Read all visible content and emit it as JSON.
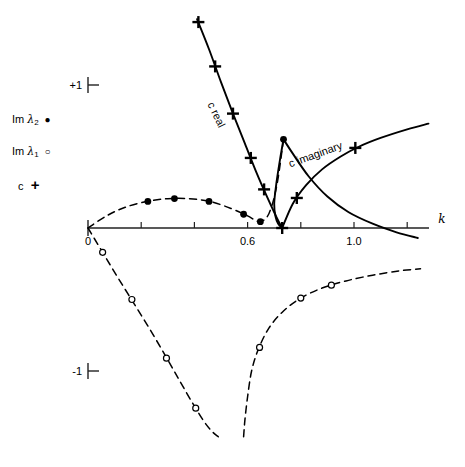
{
  "figure": {
    "title": "",
    "axis_x_label": "k",
    "axis_y_label": ""
  },
  "legend": {
    "items": [
      {
        "name": "im-lambda-2",
        "prefix": "Im",
        "symbol_text": "λ",
        "subscript": "2",
        "marker": "filled-circle",
        "marker_glyph": "●"
      },
      {
        "name": "im-lambda-1",
        "prefix": "Im",
        "symbol_text": "λ",
        "subscript": "1",
        "marker": "open-circle",
        "marker_glyph": "○"
      },
      {
        "name": "c-marker",
        "prefix": "c",
        "symbol_text": "",
        "subscript": "",
        "marker": "plus",
        "marker_glyph": "+"
      }
    ]
  },
  "ticks": {
    "y": [
      {
        "label": "+1",
        "value": 1
      },
      {
        "label": "-1",
        "value": -1
      }
    ],
    "x": [
      {
        "label": "0",
        "value": 0
      },
      {
        "label": "0.6",
        "value": 0.6
      },
      {
        "label": "1.0",
        "value": 1.0
      }
    ],
    "x_minor_values": [
      0.2,
      0.4,
      0.8,
      1.2
    ]
  },
  "annotations": [
    {
      "name": "c-real-label",
      "text": "c real",
      "x": 0.47,
      "y": 0.78,
      "rotation": 64
    },
    {
      "name": "c-imaginary-label",
      "text": "c imaginary",
      "x": 0.86,
      "y": 0.49,
      "rotation": -20
    }
  ],
  "colors": {
    "curve": "#000000",
    "axis": "#222222",
    "background": "#ffffff"
  },
  "chart_data": {
    "type": "line",
    "title": "",
    "xlabel": "k",
    "ylabel": "",
    "xlim": [
      0,
      1.32
    ],
    "ylim": [
      -1.45,
      1.45
    ],
    "grid": false,
    "legend_position": "left",
    "series": [
      {
        "name": "c real",
        "style": "solid",
        "marker": "plus",
        "comment": "descending branch of c (real part), falls from upper left to cusp on axis",
        "x": [
          0.41,
          0.455,
          0.5,
          0.545,
          0.59,
          0.635,
          0.675,
          0.71,
          0.73
        ],
        "y": [
          1.46,
          1.25,
          1.02,
          0.8,
          0.59,
          0.38,
          0.21,
          0.07,
          0.0
        ],
        "marker_points": [
          {
            "x": 0.415,
            "y": 1.44
          },
          {
            "x": 0.478,
            "y": 1.13
          },
          {
            "x": 0.545,
            "y": 0.8
          },
          {
            "x": 0.612,
            "y": 0.49
          },
          {
            "x": 0.662,
            "y": 0.27
          },
          {
            "x": 0.73,
            "y": 0.0
          }
        ]
      },
      {
        "name": "c imaginary",
        "style": "solid",
        "marker": "plus",
        "comment": "ascending branch of c (imaginary part), rises to the right",
        "x": [
          0.73,
          0.77,
          0.82,
          0.88,
          0.95,
          1.02,
          1.1,
          1.2,
          1.28
        ],
        "y": [
          0.0,
          0.17,
          0.3,
          0.41,
          0.5,
          0.57,
          0.63,
          0.69,
          0.73
        ],
        "marker_points": [
          {
            "x": 0.785,
            "y": 0.21
          },
          {
            "x": 1.005,
            "y": 0.56
          }
        ]
      },
      {
        "name": "c loop upper",
        "style": "solid",
        "marker": "none",
        "comment": "upper arc of the teardrop emerging at the peak near k=0.735",
        "x": [
          0.735,
          0.77,
          0.83,
          0.9,
          0.98,
          1.07,
          1.16,
          1.24
        ],
        "y": [
          0.62,
          0.52,
          0.36,
          0.22,
          0.11,
          0.03,
          -0.03,
          -0.07
        ]
      },
      {
        "name": "c loop lower",
        "style": "solid",
        "marker": "none",
        "comment": "left arc of teardrop from peak down to the cusp on the axis",
        "x": [
          0.735,
          0.722,
          0.708,
          0.7,
          0.705,
          0.715,
          0.73
        ],
        "y": [
          0.62,
          0.48,
          0.31,
          0.17,
          0.08,
          0.03,
          0.0
        ]
      },
      {
        "name": "Im lambda 2",
        "style": "dashed",
        "marker": "filled-circle",
        "comment": "upper dashed curve starting at origin, gentle hump then dip then rise",
        "x": [
          0.0,
          0.07,
          0.14,
          0.22,
          0.3,
          0.38,
          0.46,
          0.54,
          0.6,
          0.645,
          0.68,
          0.71,
          0.735
        ],
        "y": [
          0.0,
          0.085,
          0.145,
          0.185,
          0.205,
          0.205,
          0.185,
          0.135,
          0.085,
          0.045,
          0.1,
          0.3,
          0.62
        ],
        "marker_points": [
          {
            "x": 0.225,
            "y": 0.186
          },
          {
            "x": 0.325,
            "y": 0.206
          },
          {
            "x": 0.455,
            "y": 0.186
          },
          {
            "x": 0.585,
            "y": 0.096
          },
          {
            "x": 0.648,
            "y": 0.044
          },
          {
            "x": 0.735,
            "y": 0.62
          }
        ]
      },
      {
        "name": "Im lambda 1 left",
        "style": "dashed",
        "marker": "open-circle",
        "comment": "lower-left dashed branch from origin diving to negative infinity",
        "x": [
          0.0,
          0.055,
          0.11,
          0.17,
          0.23,
          0.29,
          0.345,
          0.395,
          0.435,
          0.465,
          0.49
        ],
        "y": [
          0.0,
          -0.17,
          -0.34,
          -0.52,
          -0.7,
          -0.89,
          -1.07,
          -1.23,
          -1.35,
          -1.42,
          -1.46
        ],
        "marker_points": [
          {
            "x": 0.055,
            "y": -0.17
          },
          {
            "x": 0.165,
            "y": -0.5
          },
          {
            "x": 0.295,
            "y": -0.91
          },
          {
            "x": 0.405,
            "y": -1.26
          }
        ]
      },
      {
        "name": "Im lambda 1 right",
        "style": "dashed",
        "marker": "open-circle",
        "comment": "lower-right dashed branch rising from negative infinity toward an asymptote",
        "x": [
          0.585,
          0.59,
          0.6,
          0.615,
          0.64,
          0.68,
          0.735,
          0.8,
          0.88,
          0.97,
          1.07,
          1.17,
          1.25
        ],
        "y": [
          -1.46,
          -1.34,
          -1.18,
          -1.0,
          -0.85,
          -0.7,
          -0.58,
          -0.49,
          -0.42,
          -0.37,
          -0.33,
          -0.3,
          -0.285
        ],
        "marker_points": [
          {
            "x": 0.645,
            "y": -0.835
          },
          {
            "x": 0.8,
            "y": -0.49
          },
          {
            "x": 0.915,
            "y": -0.4
          }
        ]
      }
    ]
  }
}
